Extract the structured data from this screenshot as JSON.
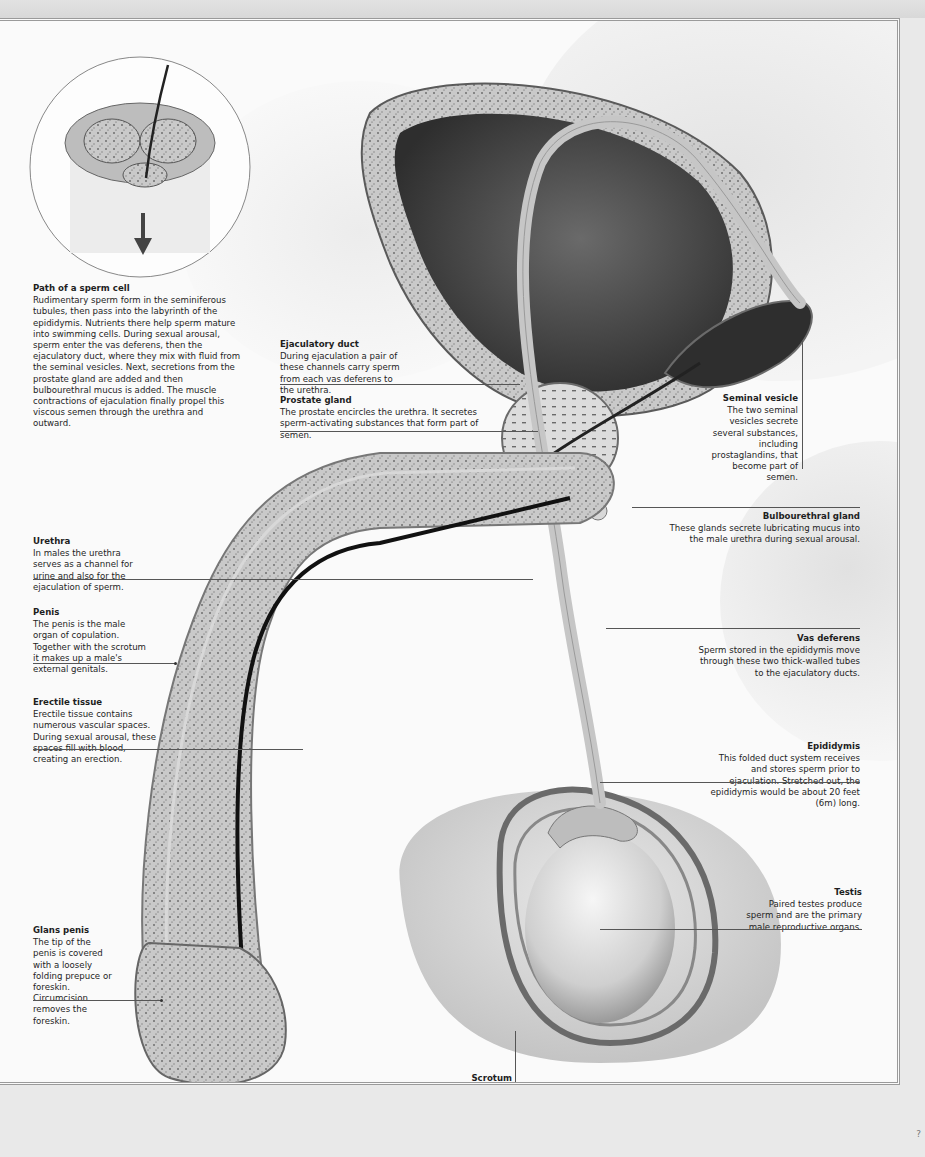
{
  "page": {
    "page_number": "?",
    "colors": {
      "background": "#fafafa",
      "outer_band": "#dcdcdc",
      "frame_line": "#9a9a9a",
      "text": "#1e1e1e",
      "tissue_dark": "#4a4a4a",
      "bladder_interior": "#3a3a3a"
    }
  },
  "inset": {
    "title": "Path of a sperm cell",
    "body": "Rudimentary sperm form in the seminiferous tubules, then pass into the labyrinth of the epididymis. Nutrients there help sperm mature into swimming cells. During sexual arousal, sperm enter the vas deferens, then the ejaculatory duct, where they mix with fluid from the seminal vesicles. Next, secretions from the prostate gland are added and then bulbourethral mucus is added. The muscle contractions of ejaculation finally propel this viscous semen through the urethra and outward.",
    "icon": "arrow-down-icon"
  },
  "labels": {
    "ejaculatory_duct": {
      "title": "Ejaculatory duct",
      "body": "During ejaculation a pair of these channels carry sperm from each vas deferens to the urethra."
    },
    "prostate_gland": {
      "title": "Prostate gland",
      "body": "The prostate encircles the urethra. It secretes sperm-activating substances that form part of semen."
    },
    "seminal_vesicle": {
      "title": "Seminal vesicle",
      "body": "The two seminal vesicles secrete several substances, including prostaglandins, that become part of semen."
    },
    "bulbourethral_gland": {
      "title": "Bulbourethral gland",
      "body": "These glands secrete lubricating mucus into the male urethra during sexual arousal."
    },
    "urethra": {
      "title": "Urethra",
      "body": "In males the urethra serves as a channel for urine and also for the ejaculation of sperm."
    },
    "penis": {
      "title": "Penis",
      "body": "The penis is the male organ of copulation. Together with the scrotum it makes up a male's external genitals."
    },
    "erectile_tissue": {
      "title": "Erectile tissue",
      "body": "Erectile tissue contains numerous vascular spaces. During sexual arousal, these spaces fill with blood, creating an erection."
    },
    "vas_deferens": {
      "title": "Vas deferens",
      "body": "Sperm stored in the epididymis move through these two thick-walled tubes to the ejaculatory ducts."
    },
    "epididymis": {
      "title": "Epididymis",
      "body": "This folded duct system receives and stores sperm prior to ejaculation. Stretched out, the epididymis would be about 20 feet (6m) long."
    },
    "testis": {
      "title": "Testis",
      "body": "Paired testes produce sperm and are the primary male reproductive organs."
    },
    "glans_penis": {
      "title": "Glans penis",
      "body": "The tip of the penis is covered with a loosely folding prepuce or foreskin. Circumcision removes the foreskin."
    },
    "scrotum": {
      "title": "Scrotum",
      "body": "This external sac at the base of the penis encloses and physically supports the testes."
    }
  }
}
